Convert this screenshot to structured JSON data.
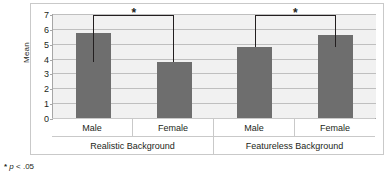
{
  "chart_data": {
    "type": "bar",
    "title": "",
    "xlabel": "",
    "ylabel": "Mean",
    "ylim": [
      0,
      7
    ],
    "yticks": [
      "0",
      "1",
      "2",
      "3",
      "4",
      "5",
      "6",
      "7"
    ],
    "grid": true,
    "legend": "none",
    "categories": [
      "Male",
      "Female",
      "Male",
      "Female"
    ],
    "groups": [
      "Realistic Background",
      "Featureless Background"
    ],
    "values": [
      5.75,
      3.8,
      4.8,
      5.6
    ],
    "bar_color": "#6e6e6e",
    "annotations": [
      {
        "label": "*",
        "from": "Male",
        "to": "Female",
        "group": "Realistic Background"
      },
      {
        "label": "*",
        "from": "Male",
        "to": "Female",
        "group": "Featureless Background"
      }
    ]
  },
  "axis": {
    "y_label": "Mean",
    "ticks": [
      {
        "value": 7,
        "label": "7"
      },
      {
        "value": 6,
        "label": "6"
      },
      {
        "value": 5,
        "label": "5"
      },
      {
        "value": 4,
        "label": "4"
      },
      {
        "value": 3,
        "label": "3"
      },
      {
        "value": 2,
        "label": "2"
      },
      {
        "value": 1,
        "label": "1"
      },
      {
        "value": 0,
        "label": "0"
      }
    ]
  },
  "categories_level1": [
    {
      "label": "Male"
    },
    {
      "label": "Female"
    },
    {
      "label": "Male"
    },
    {
      "label": "Female"
    }
  ],
  "categories_level2": [
    {
      "label": "Realistic Background"
    },
    {
      "label": "Featureless Background"
    }
  ],
  "significance": [
    {
      "star": "*"
    },
    {
      "star": "*"
    }
  ],
  "footnote": {
    "star": "*",
    "p": "p",
    "rest": " < .05"
  }
}
